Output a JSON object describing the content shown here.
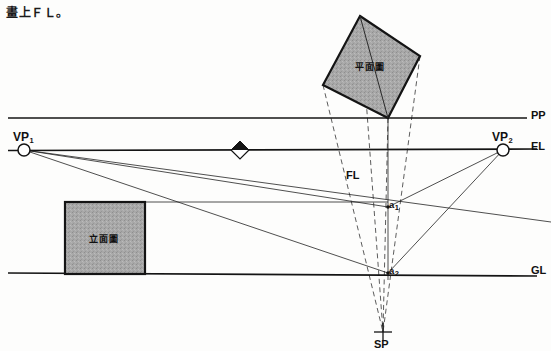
{
  "caption": {
    "text": "畫上ＦＬ。"
  },
  "figure": {
    "type": "two-point-perspective-construction",
    "title_note": "",
    "colors": {
      "line": "#1a1a1a",
      "dashed": "#4a4a4a",
      "fill_gray": "#a8a8a8",
      "background": "#fdfdfc"
    },
    "reference_lines": [
      {
        "name": "PP",
        "label": "PP",
        "y": 118,
        "x1": 8,
        "x2": 527,
        "label_x": 531,
        "label_y": 110
      },
      {
        "name": "EL",
        "label": "EL",
        "y": 150,
        "x1": 8,
        "x2": 537,
        "label_x": 531,
        "label_y": 141
      },
      {
        "name": "GL",
        "label": "GL",
        "y": 274,
        "x1": 8,
        "x2": 537,
        "label_x": 531,
        "label_y": 265
      }
    ],
    "points": [
      {
        "name": "VP1",
        "label": "VP",
        "sub": "1",
        "x": 24,
        "y": 150,
        "marker": "circle",
        "label_x": 13,
        "label_y": 131
      },
      {
        "name": "VP2",
        "label": "VP",
        "sub": "2",
        "x": 503,
        "y": 150,
        "marker": "circle",
        "label_x": 492,
        "label_y": 131
      },
      {
        "name": "SP",
        "label": "SP",
        "x": 383,
        "y": 332,
        "marker": "cross",
        "label_x": 375,
        "label_y": 339
      },
      {
        "name": "a1",
        "label": "a",
        "sub": "1",
        "x": 388,
        "y": 207,
        "marker": "dot",
        "label_x": 389,
        "label_y": 201
      },
      {
        "name": "a2",
        "label": "a",
        "sub": "2",
        "x": 388,
        "y": 273,
        "marker": "dot",
        "label_x": 389,
        "label_y": 267
      }
    ],
    "markers": [
      {
        "name": "center-of-vision-diamond",
        "x": 240,
        "y": 150,
        "size": 9
      }
    ],
    "annotations": [
      {
        "name": "FL",
        "label": "FL",
        "x": 346,
        "y": 170
      }
    ],
    "plan_shape": {
      "name": "plan-view-square",
      "label": "平面圖",
      "label_x": 355,
      "label_y": 64,
      "points": "360,16 420,56 388,118 323,85",
      "diagonal": "360,16 388,118"
    },
    "elevation_shape": {
      "name": "elevation-view-rect",
      "label": "立面圖",
      "label_x": 89,
      "label_y": 236,
      "x": 65,
      "y": 202,
      "width": 80,
      "height": 72
    },
    "solid_lines": [
      {
        "name": "vp1-to-a1",
        "x1": 24,
        "y1": 150,
        "x2": 388,
        "y2": 207
      },
      {
        "name": "vp1-to-a2",
        "x1": 24,
        "y1": 150,
        "x2": 388,
        "y2": 273
      },
      {
        "name": "vp1-to-right-edge",
        "x1": 24,
        "y1": 150,
        "x2": 551,
        "y2": 222
      },
      {
        "name": "vp2-to-a1",
        "x1": 503,
        "y1": 150,
        "x2": 388,
        "y2": 207
      },
      {
        "name": "vp2-to-a2",
        "x1": 503,
        "y1": 150,
        "x2": 388,
        "y2": 273
      },
      {
        "name": "elevation-top-horizontal",
        "x1": 65,
        "y1": 202,
        "x2": 388,
        "y2": 202
      },
      {
        "name": "measuring-vertical",
        "x1": 388,
        "y1": 118,
        "x2": 388,
        "y2": 280
      }
    ],
    "dashed_lines": [
      {
        "name": "plan-left-corner-to-sp",
        "x1": 323,
        "y1": 85,
        "x2": 383,
        "y2": 332
      },
      {
        "name": "plan-top-corner-to-sp",
        "x1": 360,
        "y1": 16,
        "x2": 383,
        "y2": 332
      },
      {
        "name": "plan-bottom-corner-to-sp",
        "x1": 388,
        "y1": 118,
        "x2": 383,
        "y2": 332
      },
      {
        "name": "plan-right-corner-to-sp",
        "x1": 420,
        "y1": 56,
        "x2": 383,
        "y2": 332
      }
    ]
  }
}
